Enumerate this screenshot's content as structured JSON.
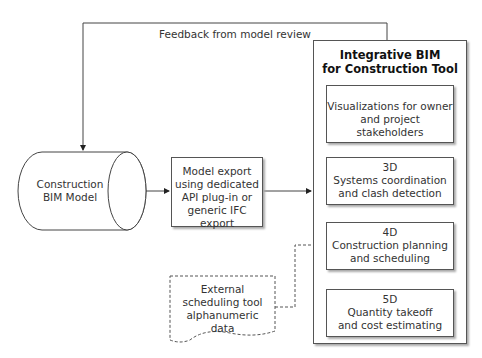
{
  "diagram": {
    "feedback_label": "Feedback from model review",
    "cylinder": {
      "line1": "Construction",
      "line2": "BIM Model"
    },
    "export_box": {
      "lines": [
        "Model export",
        "using dedicated",
        "API plug-in or",
        "generic IFC export"
      ]
    },
    "external": {
      "lines": [
        "External",
        "scheduling tool",
        "alphanumeric",
        "data"
      ]
    },
    "tool": {
      "title_line1": "Integrative BIM",
      "title_line2": "for Construction Tool",
      "modules": [
        {
          "tag": "",
          "line1": "Visualizations for owner",
          "line2": "and project stakeholders"
        },
        {
          "tag": "3D",
          "line1": "Systems coordination",
          "line2": "and clash detection"
        },
        {
          "tag": "4D",
          "line1": "Construction planning",
          "line2": "and scheduling"
        },
        {
          "tag": "5D",
          "line1": "Quantity takeoff",
          "line2": "and cost estimating"
        }
      ]
    },
    "colors": {
      "line": "#333333",
      "shadow": "#aaaaaa",
      "background": "#ffffff"
    }
  }
}
